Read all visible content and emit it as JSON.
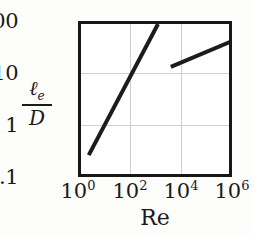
{
  "chart_data": {
    "type": "line",
    "title": "",
    "xlabel": "Re",
    "ylabel": "ℓe/D",
    "ylabel_numerator": "ℓ",
    "ylabel_numerator_sub": "e",
    "ylabel_denominator": "D",
    "xscale": "log",
    "yscale": "log",
    "xlim": [
      1,
      1000000
    ],
    "ylim": [
      0.1,
      100
    ],
    "grid": true,
    "legend": "none",
    "xticks": [
      {
        "value": 1,
        "mantissa": "10",
        "exponent": "0",
        "label": "10^0"
      },
      {
        "value": 100,
        "mantissa": "10",
        "exponent": "2",
        "label": "10^2"
      },
      {
        "value": 10000,
        "mantissa": "10",
        "exponent": "4",
        "label": "10^4"
      },
      {
        "value": 1000000,
        "mantissa": "10",
        "exponent": "6",
        "label": "10^6"
      }
    ],
    "yticks": [
      {
        "value": 100,
        "label": "100"
      },
      {
        "value": 10,
        "label": "10"
      },
      {
        "value": 1,
        "label": "1"
      },
      {
        "value": 0.1,
        "label": "0.1"
      }
    ],
    "gridlines_x": [
      100,
      10000
    ],
    "gridlines_y": [
      10,
      1
    ],
    "series": [
      {
        "name": "laminar",
        "color": "#1c1c1c",
        "width": 4,
        "points": [
          {
            "x": 2.0,
            "y": 0.3
          },
          {
            "x": 1000.0,
            "y": 100.0
          }
        ]
      },
      {
        "name": "turbulent",
        "color": "#1c1c1c",
        "width": 4,
        "points": [
          {
            "x": 3160.0,
            "y": 15.0
          },
          {
            "x": 631000.0,
            "y": 45.0
          }
        ]
      }
    ]
  }
}
